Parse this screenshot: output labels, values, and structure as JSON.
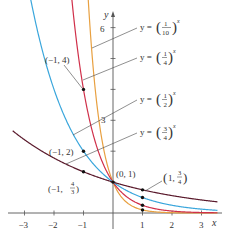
{
  "chart_data": {
    "type": "line",
    "title": "",
    "xlabel": "x",
    "ylabel": "y",
    "xlim": [
      -3.4,
      3.6
    ],
    "ylim": [
      -0.5,
      6.8
    ],
    "grid": false,
    "x_ticks": [
      -3,
      -2,
      -1,
      1,
      2,
      3
    ],
    "x_tick_labels": [
      "−3",
      "−2",
      "−1",
      "1",
      "2",
      "3"
    ],
    "y_ticks": [
      1,
      2,
      3,
      4,
      5,
      6
    ],
    "y_tick_labels": {
      "3": "3",
      "6": "6"
    },
    "series": [
      {
        "name": "y = (1/10)^x",
        "base": 0.1,
        "color": "#e8a040",
        "label_num": "1",
        "label_den": "10"
      },
      {
        "name": "y = (1/4)^x",
        "base": 0.25,
        "color": "#d0304a",
        "label_num": "1",
        "label_den": "4"
      },
      {
        "name": "y = (1/2)^x",
        "base": 0.5,
        "color": "#3aa6dc",
        "label_num": "1",
        "label_den": "2"
      },
      {
        "name": "y = (3/4)^x",
        "base": 0.75,
        "color": "#5a1a2c",
        "label_num": "3",
        "label_den": "4"
      }
    ],
    "annotations": [
      {
        "text": "(−1, 4)",
        "x": -1,
        "y": 4
      },
      {
        "text": "(−1, 2)",
        "x": -1,
        "y": 2
      },
      {
        "text": "(−1, 4/3)",
        "x": -1,
        "y": 1.3333
      },
      {
        "text": "(0, 1)",
        "x": 0,
        "y": 1
      },
      {
        "text": "(1, 3/4)",
        "x": 1,
        "y": 0.75
      }
    ],
    "marked_points": [
      {
        "x": -1,
        "y": 4
      },
      {
        "x": -1,
        "y": 2
      },
      {
        "x": -1,
        "y": 1.3333
      },
      {
        "x": 0,
        "y": 1
      },
      {
        "x": 1,
        "y": 0.75
      },
      {
        "x": 1,
        "y": 0.5
      },
      {
        "x": 1,
        "y": 0.25
      },
      {
        "x": 1,
        "y": 0.1
      }
    ]
  },
  "labels": {
    "y_axis": "y",
    "x_axis": "x",
    "y_eq": "y =",
    "tick6": "6",
    "tick3": "3",
    "p_m1_4": "(−1, 4)",
    "p_m1_2": "(−1, 2)",
    "p_m1_43_prefix": "(−1,",
    "p_m1_43_num": "4",
    "p_m1_43_den": "3",
    "p_0_1": "(0, 1)",
    "p_1_34_prefix": "1,",
    "p_1_34_num": "3",
    "p_1_34_den": "4"
  }
}
